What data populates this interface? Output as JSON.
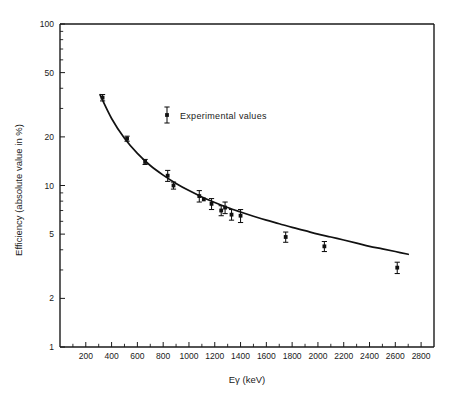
{
  "chart_data": {
    "type": "scatter",
    "title": "",
    "xlabel": "Eγ (keV)",
    "ylabel": "Efficiency (absolute value in %)",
    "xlim": [
      0,
      2900
    ],
    "ylim": [
      1,
      100
    ],
    "yscale": "log",
    "xscale": "linear",
    "grid": false,
    "legend_position": "upper-center-inside",
    "xticks": [
      200,
      400,
      600,
      800,
      1000,
      1200,
      1400,
      1600,
      1800,
      2000,
      2200,
      2400,
      2600,
      2800
    ],
    "xticklabels": [
      "200",
      "400",
      "600",
      "800",
      "1000",
      "1200",
      "1400",
      "1600",
      "1800",
      "2000",
      "2200",
      "2400",
      "2600",
      "2800"
    ],
    "xtick_minor_step": 100,
    "yticks": [
      1,
      2,
      5,
      10,
      20,
      50,
      100
    ],
    "yticklabels": [
      "1",
      "2",
      "5",
      "10",
      "20",
      "50",
      "100"
    ],
    "series": [
      {
        "name": "Experimental values",
        "marker": "square-with-errorbar",
        "color": "#111111",
        "x": [
          330,
          520,
          660,
          835,
          880,
          1080,
          1115,
          1175,
          1250,
          1280,
          1330,
          1400,
          1750,
          2050,
          2615
        ],
        "y": [
          35.0,
          19.5,
          14.0,
          11.5,
          10.0,
          8.6,
          8.2,
          7.7,
          7.0,
          7.3,
          6.6,
          6.5,
          4.8,
          4.2,
          3.1
        ],
        "yerr": [
          1.6,
          0.7,
          0.5,
          0.9,
          0.5,
          0.7,
          0.0,
          0.6,
          0.5,
          0.6,
          0.5,
          0.6,
          0.35,
          0.3,
          0.25
        ]
      },
      {
        "name": "Fitted efficiency curve",
        "marker": "none",
        "color": "#111111",
        "x": [
          310,
          400,
          500,
          600,
          700,
          800,
          900,
          1000,
          1100,
          1200,
          1300,
          1400,
          1500,
          1600,
          1700,
          1800,
          1900,
          2000,
          2100,
          2200,
          2300,
          2400,
          2500,
          2600,
          2700
        ],
        "y": [
          36.5,
          26.0,
          19.6,
          15.8,
          13.3,
          11.6,
          10.3,
          9.3,
          8.5,
          7.85,
          7.3,
          6.85,
          6.45,
          6.1,
          5.8,
          5.5,
          5.25,
          5.0,
          4.8,
          4.6,
          4.4,
          4.2,
          4.05,
          3.9,
          3.75
        ]
      }
    ],
    "legend": [
      {
        "label": "Experimental values",
        "marker": "square-with-errorbar",
        "color": "#111111"
      }
    ],
    "annotations": []
  }
}
